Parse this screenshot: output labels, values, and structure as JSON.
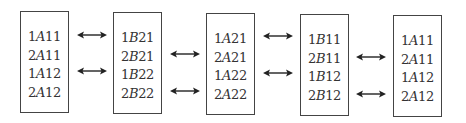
{
  "diagram": {
    "boxes": [
      {
        "id": "box-1",
        "x": 20,
        "y": 11,
        "entries": [
          {
            "pre": "1",
            "it": "A",
            "post": "11"
          },
          {
            "pre": "2",
            "it": "A",
            "post": "11"
          },
          {
            "pre": "1",
            "it": "A",
            "post": "12"
          },
          {
            "pre": "2",
            "it": "A",
            "post": "12"
          }
        ]
      },
      {
        "id": "box-2",
        "x": 113,
        "y": 12,
        "entries": [
          {
            "pre": "1",
            "it": "B",
            "post": "21"
          },
          {
            "pre": "2",
            "it": "B",
            "post": "21"
          },
          {
            "pre": "1",
            "it": "B",
            "post": "22"
          },
          {
            "pre": "2",
            "it": "B",
            "post": "22"
          }
        ]
      },
      {
        "id": "box-3",
        "x": 206,
        "y": 13,
        "entries": [
          {
            "pre": "1",
            "it": "A",
            "post": "21"
          },
          {
            "pre": "2",
            "it": "A",
            "post": "21"
          },
          {
            "pre": "1",
            "it": "A",
            "post": "22"
          },
          {
            "pre": "2",
            "it": "A",
            "post": "22"
          }
        ]
      },
      {
        "id": "box-4",
        "x": 300,
        "y": 14,
        "entries": [
          {
            "pre": "1",
            "it": "B",
            "post": "11"
          },
          {
            "pre": "2",
            "it": "B",
            "post": "11"
          },
          {
            "pre": "1",
            "it": "B",
            "post": "12"
          },
          {
            "pre": "2",
            "it": "B",
            "post": "12"
          }
        ]
      },
      {
        "id": "box-5",
        "x": 393,
        "y": 15,
        "entries": [
          {
            "pre": "1",
            "it": "A",
            "post": "11"
          },
          {
            "pre": "2",
            "it": "A",
            "post": "11"
          },
          {
            "pre": "1",
            "it": "A",
            "post": "12"
          },
          {
            "pre": "2",
            "it": "A",
            "post": "12"
          }
        ]
      }
    ],
    "arrows": [
      {
        "x": 77,
        "y": 30,
        "type": "double"
      },
      {
        "x": 77,
        "y": 66,
        "type": "double"
      },
      {
        "x": 170,
        "y": 49,
        "type": "double"
      },
      {
        "x": 170,
        "y": 86,
        "type": "double"
      },
      {
        "x": 263,
        "y": 31,
        "type": "double"
      },
      {
        "x": 263,
        "y": 68,
        "type": "double"
      },
      {
        "x": 356,
        "y": 52,
        "type": "double"
      },
      {
        "x": 356,
        "y": 89,
        "type": "double"
      }
    ]
  }
}
